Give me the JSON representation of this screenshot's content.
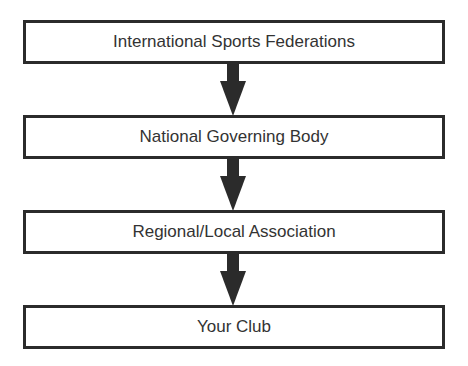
{
  "diagram": {
    "type": "hierarchy-flowchart",
    "direction": "top-to-bottom",
    "nodes": [
      {
        "id": "n1",
        "label": "International Sports Federations"
      },
      {
        "id": "n2",
        "label": "National Governing Body"
      },
      {
        "id": "n3",
        "label": "Regional/Local Association"
      },
      {
        "id": "n4",
        "label": "Your Club"
      }
    ],
    "edges": [
      {
        "from": "n1",
        "to": "n2"
      },
      {
        "from": "n2",
        "to": "n3"
      },
      {
        "from": "n3",
        "to": "n4"
      }
    ],
    "colors": {
      "border": "#2b2b2b",
      "text": "#333333",
      "arrow": "#2b2b2b",
      "background": "#ffffff"
    }
  }
}
